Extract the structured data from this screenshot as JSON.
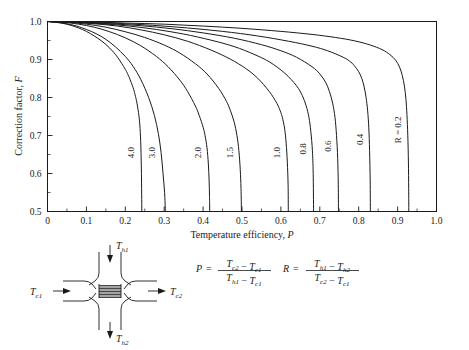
{
  "chart_data": {
    "type": "line",
    "title": "",
    "xlabel": "Temperature efficiency, P",
    "ylabel": "Correction factor, F",
    "xlim": [
      0,
      1.0
    ],
    "ylim": [
      0.5,
      1.0
    ],
    "xticks": [
      "0",
      "0.1",
      "0.2",
      "0.3",
      "0.4",
      "0.5",
      "0.6",
      "0.7",
      "0.8",
      "0.9",
      "1.0"
    ],
    "yticks": [
      "0.5",
      "0.6",
      "0.7",
      "0.8",
      "0.9",
      "1.0"
    ],
    "xtick_values": [
      0,
      0.1,
      0.2,
      0.3,
      0.4,
      0.5,
      0.6,
      0.7,
      0.8,
      0.9,
      1.0
    ],
    "ytick_values": [
      0.5,
      0.6,
      0.7,
      0.8,
      0.9,
      1.0
    ],
    "minor_tick_step": 0.05,
    "grid": false,
    "legend": "inline-curve-labels",
    "series": [
      {
        "name": "4.0",
        "label": "4.0",
        "R": 4.0,
        "points": [
          [
            0.0,
            1.0
          ],
          [
            0.02,
            0.998
          ],
          [
            0.04,
            0.995
          ],
          [
            0.06,
            0.99
          ],
          [
            0.08,
            0.983
          ],
          [
            0.1,
            0.974
          ],
          [
            0.12,
            0.962
          ],
          [
            0.14,
            0.948
          ],
          [
            0.16,
            0.93
          ],
          [
            0.18,
            0.906
          ],
          [
            0.2,
            0.874
          ],
          [
            0.21,
            0.853
          ],
          [
            0.22,
            0.826
          ],
          [
            0.225,
            0.808
          ],
          [
            0.23,
            0.785
          ],
          [
            0.235,
            0.752
          ],
          [
            0.238,
            0.718
          ],
          [
            0.24,
            0.67
          ],
          [
            0.2415,
            0.6
          ],
          [
            0.2425,
            0.5
          ]
        ]
      },
      {
        "name": "3.0",
        "label": "3.0",
        "R": 3.0,
        "points": [
          [
            0.0,
            1.0
          ],
          [
            0.025,
            0.998
          ],
          [
            0.05,
            0.994
          ],
          [
            0.075,
            0.988
          ],
          [
            0.1,
            0.979
          ],
          [
            0.125,
            0.968
          ],
          [
            0.15,
            0.953
          ],
          [
            0.175,
            0.933
          ],
          [
            0.2,
            0.908
          ],
          [
            0.22,
            0.882
          ],
          [
            0.24,
            0.847
          ],
          [
            0.26,
            0.8
          ],
          [
            0.275,
            0.752
          ],
          [
            0.285,
            0.705
          ],
          [
            0.292,
            0.655
          ],
          [
            0.297,
            0.6
          ],
          [
            0.301,
            0.55
          ],
          [
            0.303,
            0.5
          ]
        ]
      },
      {
        "name": "2.0",
        "label": "2.0",
        "R": 2.0,
        "points": [
          [
            0.0,
            1.0
          ],
          [
            0.04,
            0.998
          ],
          [
            0.08,
            0.993
          ],
          [
            0.12,
            0.985
          ],
          [
            0.16,
            0.973
          ],
          [
            0.2,
            0.957
          ],
          [
            0.24,
            0.936
          ],
          [
            0.28,
            0.908
          ],
          [
            0.31,
            0.881
          ],
          [
            0.34,
            0.846
          ],
          [
            0.36,
            0.816
          ],
          [
            0.38,
            0.778
          ],
          [
            0.39,
            0.753
          ],
          [
            0.4,
            0.722
          ],
          [
            0.405,
            0.7
          ],
          [
            0.41,
            0.668
          ],
          [
            0.4135,
            0.625
          ],
          [
            0.4155,
            0.58
          ],
          [
            0.4165,
            0.54
          ],
          [
            0.417,
            0.5
          ]
        ]
      },
      {
        "name": "1.5",
        "label": "1.5",
        "R": 1.5,
        "points": [
          [
            0.0,
            1.0
          ],
          [
            0.05,
            0.998
          ],
          [
            0.1,
            0.993
          ],
          [
            0.15,
            0.985
          ],
          [
            0.2,
            0.973
          ],
          [
            0.25,
            0.958
          ],
          [
            0.3,
            0.938
          ],
          [
            0.34,
            0.917
          ],
          [
            0.38,
            0.889
          ],
          [
            0.41,
            0.862
          ],
          [
            0.44,
            0.824
          ],
          [
            0.46,
            0.79
          ],
          [
            0.47,
            0.766
          ],
          [
            0.48,
            0.735
          ],
          [
            0.487,
            0.7
          ],
          [
            0.492,
            0.66
          ],
          [
            0.4955,
            0.61
          ],
          [
            0.4975,
            0.56
          ],
          [
            0.4985,
            0.5
          ]
        ]
      },
      {
        "name": "1.0",
        "label": "1.0",
        "R": 1.0,
        "points": [
          [
            0.0,
            1.0
          ],
          [
            0.06,
            0.998
          ],
          [
            0.12,
            0.994
          ],
          [
            0.18,
            0.988
          ],
          [
            0.24,
            0.978
          ],
          [
            0.3,
            0.965
          ],
          [
            0.36,
            0.948
          ],
          [
            0.42,
            0.925
          ],
          [
            0.47,
            0.901
          ],
          [
            0.51,
            0.876
          ],
          [
            0.54,
            0.851
          ],
          [
            0.57,
            0.816
          ],
          [
            0.59,
            0.784
          ],
          [
            0.6,
            0.76
          ],
          [
            0.605,
            0.742
          ],
          [
            0.61,
            0.715
          ],
          [
            0.6135,
            0.68
          ],
          [
            0.6165,
            0.63
          ],
          [
            0.6185,
            0.57
          ],
          [
            0.619,
            0.5
          ]
        ]
      },
      {
        "name": "0.8",
        "label": "0.8",
        "R": 0.8,
        "points": [
          [
            0.0,
            1.0
          ],
          [
            0.07,
            0.998
          ],
          [
            0.14,
            0.994
          ],
          [
            0.21,
            0.988
          ],
          [
            0.28,
            0.979
          ],
          [
            0.35,
            0.967
          ],
          [
            0.42,
            0.951
          ],
          [
            0.48,
            0.934
          ],
          [
            0.53,
            0.914
          ],
          [
            0.57,
            0.894
          ],
          [
            0.61,
            0.864
          ],
          [
            0.64,
            0.831
          ],
          [
            0.655,
            0.805
          ],
          [
            0.665,
            0.778
          ],
          [
            0.672,
            0.748
          ],
          [
            0.677,
            0.71
          ],
          [
            0.681,
            0.66
          ],
          [
            0.683,
            0.6
          ],
          [
            0.684,
            0.5
          ]
        ]
      },
      {
        "name": "0.6",
        "label": "0.6",
        "R": 0.6,
        "points": [
          [
            0.0,
            1.0
          ],
          [
            0.08,
            0.998
          ],
          [
            0.16,
            0.994
          ],
          [
            0.24,
            0.989
          ],
          [
            0.32,
            0.981
          ],
          [
            0.4,
            0.97
          ],
          [
            0.48,
            0.956
          ],
          [
            0.55,
            0.939
          ],
          [
            0.6,
            0.923
          ],
          [
            0.64,
            0.906
          ],
          [
            0.68,
            0.881
          ],
          [
            0.7,
            0.862
          ],
          [
            0.715,
            0.84
          ],
          [
            0.725,
            0.815
          ],
          [
            0.733,
            0.785
          ],
          [
            0.739,
            0.748
          ],
          [
            0.743,
            0.7
          ],
          [
            0.746,
            0.64
          ],
          [
            0.7475,
            0.57
          ],
          [
            0.748,
            0.5
          ]
        ]
      },
      {
        "name": "0.4",
        "label": "0.4",
        "R": 0.4,
        "points": [
          [
            0.0,
            1.0
          ],
          [
            0.09,
            0.998
          ],
          [
            0.18,
            0.995
          ],
          [
            0.27,
            0.99
          ],
          [
            0.36,
            0.983
          ],
          [
            0.45,
            0.974
          ],
          [
            0.54,
            0.962
          ],
          [
            0.62,
            0.948
          ],
          [
            0.68,
            0.935
          ],
          [
            0.72,
            0.923
          ],
          [
            0.76,
            0.906
          ],
          [
            0.78,
            0.893
          ],
          [
            0.79,
            0.882
          ],
          [
            0.8,
            0.868
          ],
          [
            0.808,
            0.85
          ],
          [
            0.814,
            0.828
          ],
          [
            0.819,
            0.8
          ],
          [
            0.823,
            0.765
          ],
          [
            0.826,
            0.72
          ],
          [
            0.828,
            0.66
          ],
          [
            0.8295,
            0.58
          ],
          [
            0.83,
            0.5
          ]
        ]
      },
      {
        "name": "R = 0.2",
        "label": "R = 0.2",
        "R": 0.2,
        "points": [
          [
            0.0,
            1.0
          ],
          [
            0.1,
            0.999
          ],
          [
            0.2,
            0.996
          ],
          [
            0.3,
            0.993
          ],
          [
            0.4,
            0.988
          ],
          [
            0.5,
            0.982
          ],
          [
            0.6,
            0.974
          ],
          [
            0.68,
            0.966
          ],
          [
            0.74,
            0.958
          ],
          [
            0.79,
            0.949
          ],
          [
            0.83,
            0.938
          ],
          [
            0.86,
            0.926
          ],
          [
            0.88,
            0.913
          ],
          [
            0.895,
            0.898
          ],
          [
            0.905,
            0.88
          ],
          [
            0.912,
            0.858
          ],
          [
            0.9175,
            0.83
          ],
          [
            0.9215,
            0.795
          ],
          [
            0.924,
            0.755
          ],
          [
            0.9262,
            0.7
          ],
          [
            0.9278,
            0.63
          ],
          [
            0.9285,
            0.56
          ],
          [
            0.9288,
            0.5
          ]
        ]
      }
    ]
  },
  "diagram": {
    "name": "cross-flow-heat-exchanger",
    "labels": {
      "hot_in": {
        "base": "T",
        "sub": "h1"
      },
      "hot_out": {
        "base": "T",
        "sub": "h2"
      },
      "cold_in": {
        "base": "T",
        "sub": "c1"
      },
      "cold_out": {
        "base": "T",
        "sub": "c2"
      }
    },
    "plate_count": 9
  },
  "formulas": {
    "P": {
      "lhs": "P",
      "equals": "=",
      "numerator": [
        {
          "base": "T",
          "sub": "c2"
        },
        {
          "op": "−"
        },
        {
          "base": "T",
          "sub": "c1"
        }
      ],
      "denominator": [
        {
          "base": "T",
          "sub": "h1"
        },
        {
          "op": "−"
        },
        {
          "base": "T",
          "sub": "c1"
        }
      ]
    },
    "R": {
      "lhs": "R",
      "equals": "=",
      "numerator": [
        {
          "base": "T",
          "sub": "h1"
        },
        {
          "op": "−"
        },
        {
          "base": "T",
          "sub": "h2"
        }
      ],
      "denominator": [
        {
          "base": "T",
          "sub": "c2"
        },
        {
          "op": "−"
        },
        {
          "base": "T",
          "sub": "c1"
        }
      ]
    }
  },
  "colors": {
    "ink": "#1a1a1a",
    "background": "#ffffff"
  }
}
